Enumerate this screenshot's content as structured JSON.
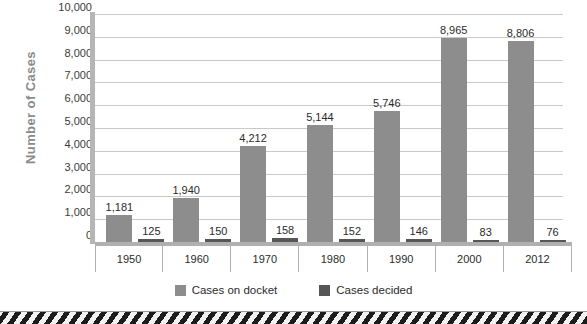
{
  "chart_data": {
    "type": "bar",
    "title": "",
    "xlabel": "",
    "ylabel": "Number of Cases",
    "ylim": [
      0,
      10000
    ],
    "ytick_step": 1000,
    "grid": true,
    "legend_position": "bottom",
    "categories": [
      "1950",
      "1960",
      "1970",
      "1980",
      "1990",
      "2000",
      "2012"
    ],
    "ytick_labels": [
      "10,000",
      "9,000",
      "8,000",
      "7,000",
      "6,000",
      "5,000",
      "4,000",
      "3,000",
      "2,000",
      "1,000",
      "0"
    ],
    "ytick_values": [
      10000,
      9000,
      8000,
      7000,
      6000,
      5000,
      4000,
      3000,
      2000,
      1000,
      0
    ],
    "series": [
      {
        "name": "Cases on docket",
        "color": "#8d8d8d",
        "values": [
          1181,
          1940,
          4212,
          5144,
          5746,
          8965,
          8806
        ],
        "labels": [
          "1,181",
          "1,940",
          "4,212",
          "5,144",
          "5,746",
          "8,965",
          "8,806"
        ]
      },
      {
        "name": "Cases decided",
        "color": "#565656",
        "values": [
          125,
          150,
          158,
          152,
          146,
          83,
          76
        ],
        "labels": [
          "125",
          "150",
          "158",
          "152",
          "146",
          "83",
          "76"
        ]
      }
    ]
  },
  "axis": {
    "y_title": "Number of Cases"
  },
  "legend": {
    "items": [
      {
        "label": "Cases on docket",
        "color": "#8d8d8d"
      },
      {
        "label": "Cases decided",
        "color": "#565656"
      }
    ]
  },
  "colors": {
    "series_docket": "#8d8d8d",
    "series_decided": "#565656",
    "gridline": "#c9c9c9",
    "axis": "#b0b0b0",
    "text": "#2b2b2b",
    "y_title": "#8a8a8a",
    "background": "#ffffff"
  }
}
